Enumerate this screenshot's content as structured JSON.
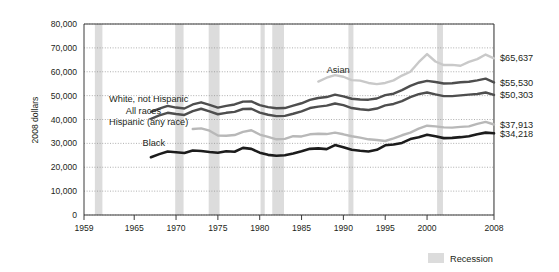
{
  "chart_data": {
    "type": "line",
    "title": "",
    "subtitle": "",
    "xlabel": "",
    "ylabel": "2008 dollars",
    "xlim": [
      1959,
      2008
    ],
    "ylim": [
      0,
      80000
    ],
    "grid": true,
    "legend_position": "bottom-right",
    "y_ticks": [
      "0",
      "10,000",
      "20,000",
      "30,000",
      "40,000",
      "50,000",
      "60,000",
      "70,000",
      "80,000"
    ],
    "y_tick_values": [
      0,
      10000,
      20000,
      30000,
      40000,
      50000,
      60000,
      70000,
      80000
    ],
    "x_ticks": [
      "1959",
      "1965",
      "1970",
      "1975",
      "1980",
      "1985",
      "1990",
      "1995",
      "2000",
      "2008"
    ],
    "x_tick_values": [
      1959,
      1965,
      1970,
      1975,
      1980,
      1985,
      1990,
      1995,
      2000,
      2008
    ],
    "legend": [
      {
        "label": "Recession",
        "color": "#dcdcdc",
        "type": "band"
      }
    ],
    "annotations": [
      {
        "text": "Asian",
        "x": 1988,
        "y": 59500
      },
      {
        "text": "White, not Hispanic",
        "x": 1962,
        "y": 47500
      },
      {
        "text": "All races",
        "x": 1964,
        "y": 42500
      },
      {
        "text": "Hispanic (any race)",
        "x": 1962,
        "y": 37800
      },
      {
        "text": "Black",
        "x": 1966,
        "y": 29000
      }
    ],
    "end_labels": [
      {
        "series": "Asian",
        "text": "$65,637",
        "value": 65637
      },
      {
        "series": "White, not Hispanic",
        "text": "$55,530",
        "value": 55530
      },
      {
        "series": "All races",
        "text": "$50,303",
        "value": 50303
      },
      {
        "series": "Hispanic (any race)",
        "text": "$37,913",
        "value": 37913
      },
      {
        "series": "Black",
        "text": "$34,218",
        "value": 34218
      }
    ],
    "recession_bands": [
      {
        "start": 1960.3,
        "end": 1961.2
      },
      {
        "start": 1969.9,
        "end": 1970.9
      },
      {
        "start": 1973.9,
        "end": 1975.2
      },
      {
        "start": 1980.1,
        "end": 1980.6
      },
      {
        "start": 1981.5,
        "end": 1982.9
      },
      {
        "start": 1990.6,
        "end": 1991.2
      },
      {
        "start": 2001.2,
        "end": 2001.9
      },
      {
        "start": 2007.9,
        "end": 2008.6
      }
    ],
    "series": [
      {
        "name": "Asian",
        "color": "#c9c9c9",
        "width": 2.4,
        "x": [
          1987,
          1988,
          1989,
          1990,
          1991,
          1992,
          1993,
          1994,
          1995,
          1996,
          1997,
          1998,
          1999,
          2000,
          2001,
          2002,
          2003,
          2004,
          2005,
          2006,
          2007,
          2008
        ],
        "values": [
          55900,
          57500,
          58600,
          57900,
          56500,
          56300,
          55300,
          54800,
          55300,
          56400,
          58400,
          60000,
          64000,
          67400,
          64300,
          62800,
          62900,
          62500,
          64100,
          65300,
          67200,
          65637
        ]
      },
      {
        "name": "White, not Hispanic",
        "color": "#4e4e4e",
        "width": 2.4,
        "x": [
          1967,
          1968,
          1969,
          1970,
          1971,
          1972,
          1973,
          1974,
          1975,
          1976,
          1977,
          1978,
          1979,
          1980,
          1981,
          1982,
          1983,
          1984,
          1985,
          1986,
          1987,
          1988,
          1989,
          1990,
          1991,
          1992,
          1993,
          1994,
          1995,
          1996,
          1997,
          1998,
          1999,
          2000,
          2001,
          2002,
          2003,
          2004,
          2005,
          2006,
          2007,
          2008
        ],
        "values": [
          43200,
          44600,
          45700,
          45000,
          44600,
          46300,
          47200,
          46100,
          45000,
          45700,
          46300,
          47500,
          47600,
          46000,
          45200,
          44700,
          44800,
          45800,
          46800,
          48200,
          49000,
          49400,
          50400,
          49700,
          48700,
          48400,
          48300,
          48800,
          50200,
          50800,
          52300,
          54100,
          55400,
          56200,
          55700,
          55100,
          55200,
          55600,
          55800,
          56400,
          57100,
          55530
        ]
      },
      {
        "name": "All races",
        "color": "#4e4e4e",
        "width": 2.4,
        "x": [
          1967,
          1968,
          1969,
          1970,
          1971,
          1972,
          1973,
          1974,
          1975,
          1976,
          1977,
          1978,
          1979,
          1980,
          1981,
          1982,
          1983,
          1984,
          1985,
          1986,
          1987,
          1988,
          1989,
          1990,
          1991,
          1992,
          1993,
          1994,
          1995,
          1996,
          1997,
          1998,
          1999,
          2000,
          2001,
          2002,
          2003,
          2004,
          2005,
          2006,
          2007,
          2008
        ],
        "values": [
          40300,
          41700,
          42800,
          42300,
          41900,
          43500,
          44500,
          43400,
          42200,
          42800,
          43200,
          44400,
          44500,
          42900,
          42000,
          41400,
          41500,
          42400,
          43400,
          44800,
          45400,
          45800,
          46700,
          46000,
          44800,
          44300,
          44000,
          44600,
          45900,
          46500,
          47700,
          49400,
          50600,
          51300,
          50500,
          49800,
          49800,
          50100,
          50400,
          50700,
          51300,
          50303
        ]
      },
      {
        "name": "Hispanic (any race)",
        "color": "#b8b8b8",
        "width": 2.4,
        "x": [
          1972,
          1973,
          1974,
          1975,
          1976,
          1977,
          1978,
          1979,
          1980,
          1981,
          1982,
          1983,
          1984,
          1985,
          1986,
          1987,
          1988,
          1989,
          1990,
          1991,
          1992,
          1993,
          1994,
          1995,
          1996,
          1997,
          1998,
          1999,
          2000,
          2001,
          2002,
          2003,
          2004,
          2005,
          2006,
          2007,
          2008
        ],
        "values": [
          36000,
          36300,
          35300,
          33300,
          33200,
          33500,
          34800,
          35500,
          33700,
          32700,
          31700,
          31900,
          33000,
          32900,
          33800,
          34000,
          33900,
          34500,
          33800,
          33000,
          32400,
          31700,
          31400,
          31000,
          32100,
          33400,
          34500,
          36200,
          37400,
          37100,
          36700,
          36600,
          36900,
          37100,
          38200,
          39000,
          37913
        ]
      },
      {
        "name": "Black",
        "color": "#1c1c1c",
        "width": 2.6,
        "x": [
          1967,
          1968,
          1969,
          1970,
          1971,
          1972,
          1973,
          1974,
          1975,
          1976,
          1977,
          1978,
          1979,
          1980,
          1981,
          1982,
          1983,
          1984,
          1985,
          1986,
          1987,
          1988,
          1989,
          1990,
          1991,
          1992,
          1993,
          1994,
          1995,
          1996,
          1997,
          1998,
          1999,
          2000,
          2001,
          2002,
          2003,
          2004,
          2005,
          2006,
          2007,
          2008
        ],
        "values": [
          24200,
          25500,
          26600,
          26300,
          26000,
          27000,
          26800,
          26400,
          26100,
          26700,
          26500,
          28100,
          27700,
          26100,
          25200,
          24800,
          25000,
          25800,
          26700,
          27700,
          27900,
          27600,
          29300,
          28400,
          27300,
          26900,
          26600,
          27300,
          29200,
          29500,
          30200,
          31800,
          32600,
          33600,
          33000,
          32200,
          32300,
          32600,
          33000,
          33800,
          34500,
          34218
        ]
      }
    ]
  },
  "legend": {
    "recession_label": "Recession"
  },
  "axes": {
    "y_title": "2008 dollars"
  }
}
